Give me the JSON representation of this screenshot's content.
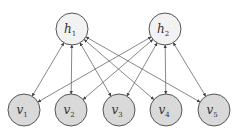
{
  "diagram": {
    "title": "",
    "colors": {
      "hidden_fill": "#f2f2f2",
      "visible_fill": "#d9d9d9",
      "stroke": "#555555",
      "edge": "#555555"
    },
    "hidden_nodes": [
      {
        "id": "h1",
        "base": "h",
        "sub": "1",
        "cx": 72,
        "cy": 29
      },
      {
        "id": "h2",
        "base": "h",
        "sub": "2",
        "cx": 165,
        "cy": 29
      }
    ],
    "visible_nodes": [
      {
        "id": "v1",
        "base": "v",
        "sub": "1",
        "cx": 24,
        "cy": 110
      },
      {
        "id": "v2",
        "base": "v",
        "sub": "2",
        "cx": 71,
        "cy": 110
      },
      {
        "id": "v3",
        "base": "v",
        "sub": "3",
        "cx": 119,
        "cy": 110
      },
      {
        "id": "v4",
        "base": "v",
        "sub": "4",
        "cx": 166,
        "cy": 110
      },
      {
        "id": "v5",
        "base": "v",
        "sub": "5",
        "cx": 214,
        "cy": 110
      }
    ],
    "node_radius": 16,
    "edges_bidirectional": true,
    "edges": [
      [
        "h1",
        "v1"
      ],
      [
        "h1",
        "v2"
      ],
      [
        "h1",
        "v3"
      ],
      [
        "h1",
        "v4"
      ],
      [
        "h1",
        "v5"
      ],
      [
        "h2",
        "v1"
      ],
      [
        "h2",
        "v2"
      ],
      [
        "h2",
        "v3"
      ],
      [
        "h2",
        "v4"
      ],
      [
        "h2",
        "v5"
      ]
    ]
  }
}
